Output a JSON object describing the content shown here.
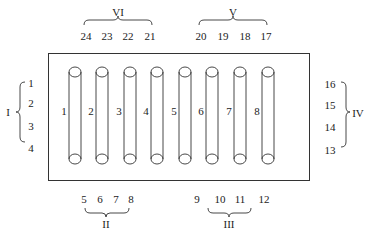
{
  "diagram": {
    "type": "electrode-array",
    "colors": {
      "stroke": "#333333",
      "background": "#ffffff"
    },
    "cylinders": [
      {
        "id": 1,
        "label": "1",
        "x": 75
      },
      {
        "id": 2,
        "label": "2",
        "x": 102
      },
      {
        "id": 3,
        "label": "3",
        "x": 130
      },
      {
        "id": 4,
        "label": "4",
        "x": 157
      },
      {
        "id": 5,
        "label": "5",
        "x": 185
      },
      {
        "id": 6,
        "label": "6",
        "x": 212
      },
      {
        "id": 7,
        "label": "7",
        "x": 240
      },
      {
        "id": 8,
        "label": "8",
        "x": 268
      }
    ],
    "groups": {
      "I": {
        "roman": "I",
        "terminals": [
          "1",
          "2",
          "3",
          "4"
        ]
      },
      "II": {
        "roman": "II",
        "terminals": [
          "5",
          "6",
          "7",
          "8"
        ]
      },
      "III": {
        "roman": "III",
        "terminals": [
          "9",
          "10",
          "11",
          "12"
        ]
      },
      "IV": {
        "roman": "IV",
        "terminals": [
          "16",
          "15",
          "14",
          "13"
        ]
      },
      "V": {
        "roman": "V",
        "terminals": [
          "20",
          "19",
          "18",
          "17"
        ]
      },
      "VI": {
        "roman": "VI",
        "terminals": [
          "24",
          "23",
          "22",
          "21"
        ]
      }
    }
  }
}
